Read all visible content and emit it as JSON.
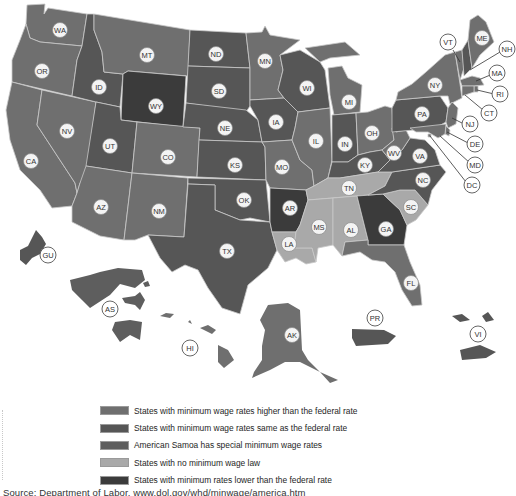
{
  "map": {
    "title": "State minimum wage laws",
    "colors": {
      "higher": "#6f6f6f",
      "same": "#565656",
      "samoa": "#5e5e5e",
      "none": "#a9a9a9",
      "lower": "#3b3b3b",
      "border": "#c9c9c9",
      "label_fill": "#f4f4f4"
    },
    "states": [
      {
        "code": "WA",
        "category": "higher"
      },
      {
        "code": "OR",
        "category": "higher"
      },
      {
        "code": "CA",
        "category": "higher"
      },
      {
        "code": "NV",
        "category": "higher"
      },
      {
        "code": "ID",
        "category": "same"
      },
      {
        "code": "MT",
        "category": "higher"
      },
      {
        "code": "WY",
        "category": "lower"
      },
      {
        "code": "UT",
        "category": "same"
      },
      {
        "code": "CO",
        "category": "higher"
      },
      {
        "code": "AZ",
        "category": "higher"
      },
      {
        "code": "NM",
        "category": "higher"
      },
      {
        "code": "ND",
        "category": "same"
      },
      {
        "code": "SD",
        "category": "same"
      },
      {
        "code": "NE",
        "category": "same"
      },
      {
        "code": "KS",
        "category": "same"
      },
      {
        "code": "OK",
        "category": "same"
      },
      {
        "code": "TX",
        "category": "same"
      },
      {
        "code": "MN",
        "category": "higher"
      },
      {
        "code": "IA",
        "category": "same"
      },
      {
        "code": "MO",
        "category": "higher"
      },
      {
        "code": "AR",
        "category": "lower"
      },
      {
        "code": "LA",
        "category": "none"
      },
      {
        "code": "WI",
        "category": "same"
      },
      {
        "code": "IL",
        "category": "higher"
      },
      {
        "code": "MI",
        "category": "higher"
      },
      {
        "code": "IN",
        "category": "same"
      },
      {
        "code": "OH",
        "category": "higher"
      },
      {
        "code": "KY",
        "category": "same"
      },
      {
        "code": "TN",
        "category": "none"
      },
      {
        "code": "MS",
        "category": "none"
      },
      {
        "code": "AL",
        "category": "none"
      },
      {
        "code": "GA",
        "category": "lower"
      },
      {
        "code": "FL",
        "category": "higher"
      },
      {
        "code": "SC",
        "category": "none"
      },
      {
        "code": "NC",
        "category": "same"
      },
      {
        "code": "VA",
        "category": "same"
      },
      {
        "code": "WV",
        "category": "higher"
      },
      {
        "code": "PA",
        "category": "same"
      },
      {
        "code": "NY",
        "category": "higher"
      },
      {
        "code": "VT",
        "category": "higher"
      },
      {
        "code": "NH",
        "category": "same"
      },
      {
        "code": "ME",
        "category": "higher"
      },
      {
        "code": "MA",
        "category": "higher"
      },
      {
        "code": "RI",
        "category": "higher"
      },
      {
        "code": "CT",
        "category": "higher"
      },
      {
        "code": "NJ",
        "category": "higher"
      },
      {
        "code": "DE",
        "category": "higher"
      },
      {
        "code": "MD",
        "category": "higher"
      },
      {
        "code": "DC",
        "category": "higher"
      },
      {
        "code": "AK",
        "category": "higher"
      },
      {
        "code": "HI",
        "category": "higher"
      },
      {
        "code": "GU",
        "category": "same"
      },
      {
        "code": "AS",
        "category": "samoa"
      },
      {
        "code": "PR",
        "category": "same"
      },
      {
        "code": "VI",
        "category": "same"
      }
    ],
    "labels": {
      "WA": "WA",
      "OR": "OR",
      "CA": "CA",
      "NV": "NV",
      "ID": "ID",
      "MT": "MT",
      "WY": "WY",
      "UT": "UT",
      "CO": "CO",
      "AZ": "AZ",
      "NM": "NM",
      "ND": "ND",
      "SD": "SD",
      "NE": "NE",
      "KS": "KS",
      "OK": "OK",
      "TX": "TX",
      "MN": "MN",
      "IA": "IA",
      "MO": "MO",
      "AR": "AR",
      "LA": "LA",
      "WI": "WI",
      "IL": "IL",
      "MI": "MI",
      "IN": "IN",
      "OH": "OH",
      "KY": "KY",
      "TN": "TN",
      "MS": "MS",
      "AL": "AL",
      "GA": "GA",
      "FL": "FL",
      "SC": "SC",
      "NC": "NC",
      "VA": "VA",
      "WV": "WV",
      "PA": "PA",
      "NY": "NY",
      "VT": "VT",
      "NH": "NH",
      "ME": "ME",
      "MA": "MA",
      "RI": "RI",
      "CT": "CT",
      "NJ": "NJ",
      "DE": "DE",
      "MD": "MD",
      "DC": "DC",
      "AK": "AK",
      "HI": "HI",
      "GU": "GU",
      "AS": "AS",
      "PR": "PR",
      "VI": "VI"
    }
  },
  "legend": {
    "items": [
      {
        "key": "higher",
        "label": "States with minimum wage rates higher than the federal rate",
        "color": "#6f6f6f"
      },
      {
        "key": "same",
        "label": "States with minimum wage rates same as the federal rate",
        "color": "#565656"
      },
      {
        "key": "samoa",
        "label": "American Samoa has special minimum wage rates",
        "color": "#5e5e5e"
      },
      {
        "key": "none",
        "label": "States with no minimum wage law",
        "color": "#a9a9a9"
      },
      {
        "key": "lower",
        "label": "States with minimum rates lower than the federal rate",
        "color": "#3b3b3b"
      }
    ]
  },
  "source": "Source: Department of Labor, www.dol.gov/whd/minwage/america.htm"
}
